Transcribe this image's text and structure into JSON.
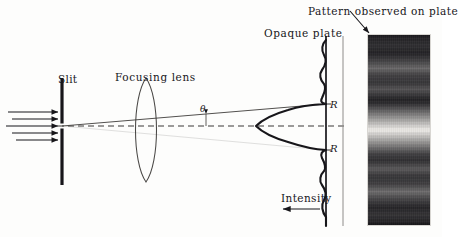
{
  "figure": {
    "title_caption": "Single-slit Fraunhofer diffraction",
    "background_color": "#fdfdfc",
    "ink_color": "#17161a",
    "width": 442,
    "height": 237
  },
  "labels": {
    "slit": "Slit",
    "focusing_lens": "Focusing lens",
    "theta": "θ",
    "opaque_plate": "Opaque plate",
    "pattern_observed": "Pattern observed on plate",
    "intensity": "Intensity",
    "r_top": "R",
    "r_bottom": "R"
  },
  "optics": {
    "incoming_rays": {
      "count": 5,
      "direction": "left-to-right",
      "y_positions": [
        112,
        119,
        126,
        133,
        140
      ],
      "x_start": 8,
      "x_end": 60
    },
    "slit": {
      "x": 62,
      "bar_top_y": 78,
      "bar_bottom_y": 185,
      "gap_center_y": 126,
      "gap_height": 5,
      "color": "#17161a"
    },
    "lens": {
      "center_x": 146,
      "center_y": 130,
      "half_height": 52,
      "bulge": 14,
      "type": "biconvex"
    },
    "axis": {
      "style": "dashed",
      "y": 126,
      "x_start": 58,
      "x_end": 348
    },
    "diffracted_ray": {
      "from_x": 62,
      "from_y": 126,
      "to_x": 326,
      "to_y": 104
    },
    "angle_marker": {
      "label": "θ",
      "vertex_x": 62,
      "tick_x": 206,
      "tick_top_y": 113,
      "tick_bottom_y": 126
    }
  },
  "plate": {
    "opaque_line": {
      "x": 326,
      "top_y": 36,
      "bottom_y": 226,
      "color": "#17161a",
      "width": 1.6
    },
    "screen_line": {
      "x": 343,
      "top_y": 36,
      "bottom_y": 226,
      "color": "#8e8c8a",
      "width": 1
    },
    "r_marks": {
      "top_y": 104,
      "bottom_y": 150
    }
  },
  "intensity_curve": {
    "type": "sinc-squared",
    "orientation": "vertical-profile-peaking-left",
    "baseline_x": 326,
    "center_y": 126,
    "peak_amplitude_px": 74,
    "first_minima_y": [
      104,
      150
    ],
    "side_lobe_amplitude_px": 9,
    "stroke": "#17161a",
    "stroke_width": 2.1
  },
  "intensity_arrow": {
    "label": "Intensity",
    "direction": "left",
    "x_start": 320,
    "x_end": 281,
    "y": 209
  },
  "pattern_photo": {
    "x": 368,
    "y": 35,
    "width": 62,
    "height": 190,
    "pointer_arrow": {
      "from_x": 350,
      "from_y": 12,
      "to_x": 369,
      "to_y": 33
    },
    "fringe_bands": [
      {
        "center_y": 0.055,
        "brightness": 0.14,
        "spread": 0.055
      },
      {
        "center_y": 0.175,
        "brightness": 0.4,
        "spread": 0.042
      },
      {
        "center_y": 0.285,
        "brightness": 0.3,
        "spread": 0.04
      },
      {
        "center_y": 0.5,
        "brightness": 1.0,
        "spread": 0.085
      },
      {
        "center_y": 0.705,
        "brightness": 0.33,
        "spread": 0.042
      },
      {
        "center_y": 0.825,
        "brightness": 0.42,
        "spread": 0.044
      },
      {
        "center_y": 0.945,
        "brightness": 0.16,
        "spread": 0.05
      }
    ],
    "base_color": "#111014",
    "bright_color": "#f2f0ec"
  }
}
